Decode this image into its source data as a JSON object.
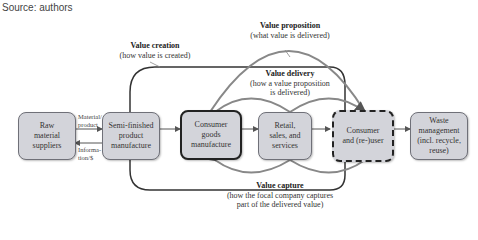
{
  "source": "Source: authors",
  "labels": {
    "value_creation": {
      "title": "Value creation",
      "sub": "(how value is created)"
    },
    "value_proposition": {
      "title": "Value proposition",
      "sub": "(what value is delivered)"
    },
    "value_delivery": {
      "title": "Value delivery",
      "sub1": "(how a value proposition",
      "sub2": "is delivered)"
    },
    "value_capture": {
      "title": "Value capture",
      "sub1": "(how the focal company captures",
      "sub2": "part of the delivered value)"
    }
  },
  "flow_labels": {
    "material": "Material/ product",
    "information": "Informa- tion/$"
  },
  "boxes": [
    {
      "id": "raw",
      "lines": [
        "Raw",
        "material",
        "suppliers"
      ]
    },
    {
      "id": "semi",
      "lines": [
        "Semi-finished",
        "product",
        "manufacture"
      ]
    },
    {
      "id": "consumer-goods",
      "lines": [
        "Consumer",
        "goods",
        "manufacture"
      ]
    },
    {
      "id": "retail",
      "lines": [
        "Retail,",
        "sales, and",
        "services"
      ]
    },
    {
      "id": "consumer",
      "lines": [
        "Consumer",
        "and (re-)user"
      ]
    },
    {
      "id": "waste",
      "lines": [
        "Waste",
        "management",
        "(incl. recycle,",
        "reuse)"
      ]
    }
  ],
  "colors": {
    "box_fill": "#d3d4da",
    "box_border": "#6f7078",
    "arrow": "#666666",
    "frame": "#222222"
  }
}
